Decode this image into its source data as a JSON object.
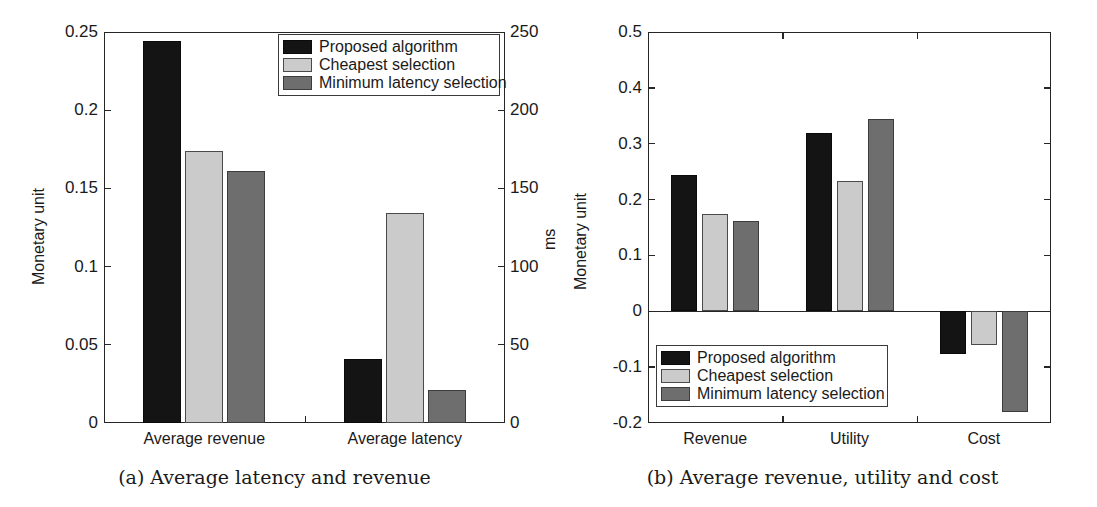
{
  "figure": {
    "panels": [
      {
        "id": "a",
        "caption": "(a) Average latency and revenue",
        "left_axis_label": "Monetary unit",
        "right_axis_label": "ms"
      },
      {
        "id": "b",
        "caption": "(b) Average revenue, utility and cost",
        "left_axis_label": "Monetary unit"
      }
    ]
  },
  "legend": {
    "entries": [
      {
        "label": "Proposed algorithm",
        "color": "#141414"
      },
      {
        "label": "Cheapest selection",
        "color": "#cbcbcb"
      },
      {
        "label": "Minimum latency selection",
        "color": "#6e6e6e"
      }
    ]
  },
  "chart_data": [
    {
      "type": "bar",
      "panel": "a",
      "title": "(a) Average latency and revenue",
      "xlabel": "",
      "ylabel": "Monetary unit",
      "y2label": "ms",
      "categories": [
        "Average revenue",
        "Average latency"
      ],
      "series": [
        {
          "name": "Proposed algorithm",
          "color": "#141414",
          "values": [
            0.244,
            0.041
          ],
          "axis": [
            "left",
            "right"
          ],
          "right_values": [
            null,
            41
          ]
        },
        {
          "name": "Cheapest selection",
          "color": "#cbcbcb",
          "values": [
            0.174,
            0.134
          ],
          "axis": [
            "left",
            "right"
          ],
          "right_values": [
            null,
            134
          ]
        },
        {
          "name": "Minimum latency selection",
          "color": "#6e6e6e",
          "values": [
            0.161,
            0.021
          ],
          "axis": [
            "left",
            "right"
          ],
          "right_values": [
            null,
            21
          ]
        }
      ],
      "ylim": [
        0,
        0.25
      ],
      "yticks": [
        "0",
        "0.05",
        "0.1",
        "0.15",
        "0.2",
        "0.25"
      ],
      "ytick_values": [
        0,
        0.05,
        0.1,
        0.15,
        0.2,
        0.25
      ],
      "y2lim": [
        0,
        250
      ],
      "y2ticks": [
        "0",
        "50",
        "100",
        "150",
        "200",
        "250"
      ],
      "y2tick_values": [
        0,
        50,
        100,
        150,
        200,
        250
      ],
      "grid": false,
      "legend_position": "top-right"
    },
    {
      "type": "bar",
      "panel": "b",
      "title": "(b) Average revenue, utility and cost",
      "xlabel": "",
      "ylabel": "Monetary unit",
      "categories": [
        "Revenue",
        "Utility",
        "Cost"
      ],
      "series": [
        {
          "name": "Proposed algorithm",
          "color": "#141414",
          "values": [
            0.244,
            0.319,
            -0.077
          ]
        },
        {
          "name": "Cheapest selection",
          "color": "#cbcbcb",
          "values": [
            0.174,
            0.234,
            -0.061
          ]
        },
        {
          "name": "Minimum latency selection",
          "color": "#6e6e6e",
          "values": [
            0.161,
            0.345,
            -0.181
          ]
        }
      ],
      "ylim": [
        -0.2,
        0.5
      ],
      "yticks": [
        "-0.2",
        "-0.1",
        "0",
        "0.1",
        "0.2",
        "0.3",
        "0.4",
        "0.5"
      ],
      "ytick_values": [
        -0.2,
        -0.1,
        0,
        0.1,
        0.2,
        0.3,
        0.4,
        0.5
      ],
      "grid": false,
      "legend_position": "bottom-left"
    }
  ]
}
